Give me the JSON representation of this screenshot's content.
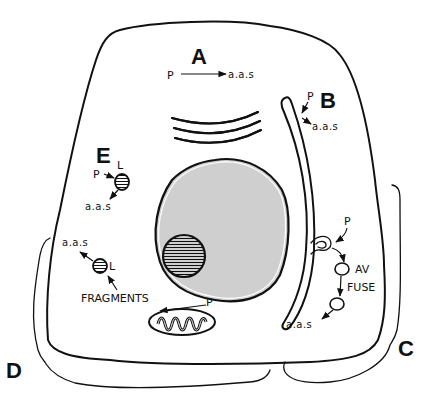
{
  "diagram": {
    "type": "cell-protein-degradation-pathways",
    "colors": {
      "ink": "#111111",
      "nucleus_fill": "#cfcfcf",
      "background": "#ffffff"
    },
    "pathways": {
      "A": {
        "letter": "A",
        "from": "P",
        "to": "a.a.s"
      },
      "B": {
        "letter": "B",
        "from": "P",
        "to": "a.a.s"
      },
      "C": {
        "letter": "C",
        "p": "P",
        "av": "AV",
        "fuse": "FUSE",
        "to": "a.a.s"
      },
      "D": {
        "letter": "D",
        "to": "a.a.s",
        "l": "L",
        "fragments": "FRAGMENTS",
        "p": "P"
      },
      "E": {
        "letter": "E",
        "p": "P",
        "l": "L",
        "to": "a.a.s"
      }
    },
    "structures": [
      "cell-membrane",
      "golgi-stack",
      "endoplasmic-reticulum",
      "nucleus",
      "lysosome",
      "mitochondrion",
      "autophagic-vacuole"
    ]
  }
}
